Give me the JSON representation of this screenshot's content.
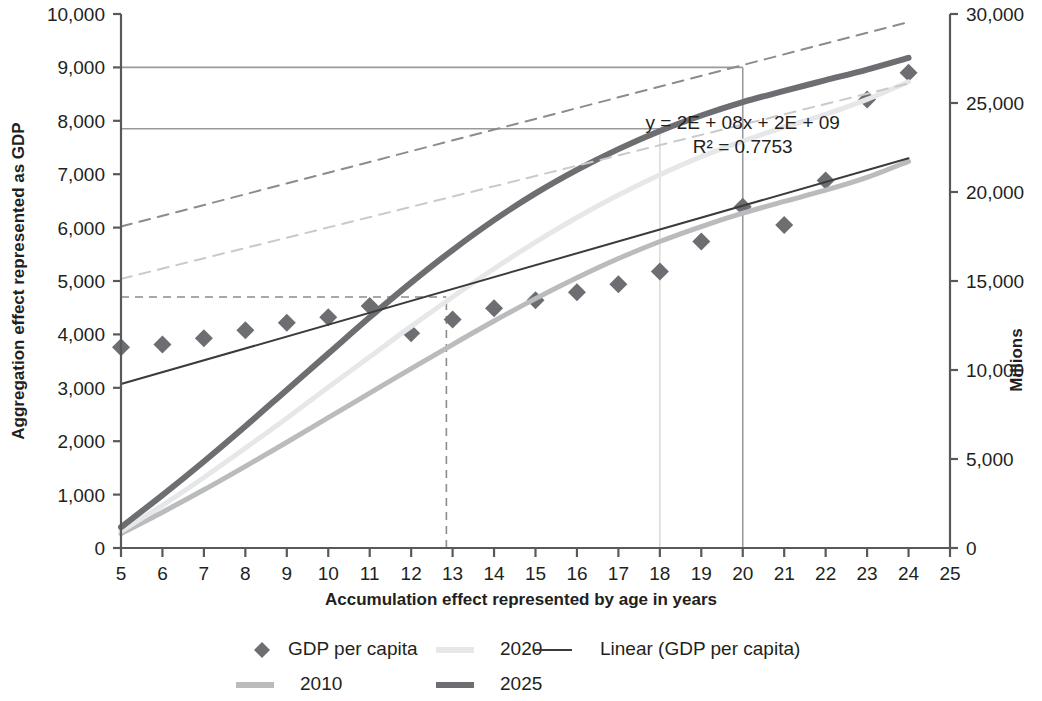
{
  "chart_data": {
    "type": "scatter",
    "title": "",
    "xlabel": "Accumulation effect represented by age in years",
    "ylabel": "Aggregation effect represented as GDP",
    "y2label": "Millions",
    "xlim": [
      5,
      25
    ],
    "ylim": [
      0,
      10000
    ],
    "y2lim": [
      0,
      30000
    ],
    "grid": false,
    "legend_position": "bottom",
    "x_ticks": [
      "5",
      "6",
      "7",
      "8",
      "9",
      "10",
      "11",
      "12",
      "13",
      "14",
      "15",
      "16",
      "17",
      "18",
      "19",
      "20",
      "21",
      "22",
      "23",
      "24",
      "25"
    ],
    "y_ticks": [
      "0",
      "1,000",
      "2,000",
      "3,000",
      "4,000",
      "5,000",
      "6,000",
      "7,000",
      "8,000",
      "9,000",
      "10,000"
    ],
    "y2_ticks": [
      "0",
      "5,000",
      "10,000",
      "15,000",
      "20,000",
      "25,000",
      "30,000"
    ],
    "annotations": [
      {
        "name": "trendline-equation",
        "text": "y = 2E + 08x + 2E + 09",
        "x": 20.0,
        "y": 7850
      },
      {
        "name": "r-squared",
        "text": "R² = 0.7753",
        "x": 20.0,
        "y": 7400
      }
    ],
    "series": [
      {
        "name": "GDP per capita",
        "type": "scatter",
        "marker": "diamond",
        "color": "#6d6e71",
        "x": [
          5,
          6,
          7,
          8,
          9,
          10,
          11,
          12,
          13,
          14,
          15,
          16,
          17,
          18,
          19,
          20,
          21,
          22,
          23,
          24
        ],
        "values": [
          3760,
          3810,
          3930,
          4080,
          4220,
          4320,
          4530,
          4020,
          4280,
          4490,
          4640,
          4790,
          4940,
          5180,
          5740,
          6390,
          6050,
          6880,
          8400,
          8900
        ]
      },
      {
        "name": "2010",
        "type": "line",
        "color": "#b9bbbd",
        "width": 5,
        "x": [
          5,
          6,
          7,
          8,
          9,
          10,
          11,
          12,
          13,
          14,
          15,
          16,
          17,
          18,
          19,
          20,
          21,
          22,
          23,
          24
        ],
        "values": [
          270,
          670,
          1090,
          1530,
          1980,
          2440,
          2900,
          3360,
          3810,
          4250,
          4670,
          5060,
          5420,
          5740,
          6020,
          6270,
          6490,
          6700,
          6940,
          7240
        ]
      },
      {
        "name": "2020",
        "type": "line",
        "color": "#e6e7e8",
        "width": 5,
        "x": [
          5,
          6,
          7,
          8,
          9,
          10,
          11,
          12,
          13,
          14,
          15,
          16,
          17,
          18,
          19,
          20,
          21,
          22,
          23,
          24
        ],
        "values": [
          310,
          800,
          1320,
          1870,
          2430,
          3010,
          3580,
          4150,
          4700,
          5230,
          5730,
          6190,
          6610,
          6990,
          7330,
          7620,
          7880,
          8120,
          8400,
          8730
        ]
      },
      {
        "name": "2025",
        "type": "line",
        "color": "#6d6e71",
        "width": 6,
        "x": [
          5,
          6,
          7,
          8,
          9,
          10,
          11,
          12,
          13,
          14,
          15,
          16,
          17,
          18,
          19,
          20,
          21,
          22,
          23,
          24
        ],
        "values": [
          390,
          990,
          1620,
          2280,
          2960,
          3640,
          4320,
          4970,
          5580,
          6140,
          6640,
          7080,
          7470,
          7810,
          8100,
          8350,
          8560,
          8760,
          8960,
          9180
        ]
      },
      {
        "name": "Linear (GDP per capita)",
        "type": "line",
        "style": "solid",
        "color": "#3b3b3b",
        "width": 2,
        "x": [
          5,
          24
        ],
        "values": [
          3070,
          7300
        ]
      },
      {
        "name": "trend-dashed-upper",
        "type": "line",
        "style": "dashed",
        "color": "#8a8c8e",
        "width": 2,
        "x": [
          5,
          24
        ],
        "values": [
          6020,
          9850
        ]
      },
      {
        "name": "trend-dashed-lower",
        "type": "line",
        "style": "dashed",
        "color": "#c8cacb",
        "width": 2,
        "x": [
          5,
          24
        ],
        "values": [
          5040,
          8700
        ]
      }
    ],
    "reference_lines": [
      {
        "name": "ref-h-9000",
        "orientation": "horizontal",
        "value": 9000,
        "from_x": 5,
        "to_x": 20,
        "style": "solid",
        "color": "#9a9a9a"
      },
      {
        "name": "ref-v-20",
        "orientation": "vertical",
        "value": 20,
        "from_y": 0,
        "to_y": 9000,
        "style": "solid",
        "color": "#9a9a9a"
      },
      {
        "name": "ref-h-7850",
        "orientation": "horizontal",
        "value": 7850,
        "from_x": 5,
        "to_x": 18,
        "style": "solid",
        "color": "#9a9a9a"
      },
      {
        "name": "ref-v-18",
        "orientation": "vertical",
        "value": 18,
        "from_y": 0,
        "to_y": 7850,
        "style": "solid",
        "color": "#dcdcdc"
      },
      {
        "name": "ref-h-4700",
        "orientation": "horizontal",
        "value": 4700,
        "from_x": 5,
        "to_x": 12.85,
        "style": "dashed",
        "color": "#8a8c8e"
      },
      {
        "name": "ref-v-1285",
        "orientation": "vertical",
        "value": 12.85,
        "from_y": 0,
        "to_y": 4700,
        "style": "dashed",
        "color": "#8a8c8e"
      }
    ],
    "legend": [
      {
        "label": "GDP per capita",
        "marker": "diamond",
        "color": "#6d6e71"
      },
      {
        "label": "2020",
        "marker": "line",
        "color": "#e6e7e8"
      },
      {
        "label": "Linear (GDP per capita)",
        "marker": "thin-line",
        "color": "#3b3b3b"
      },
      {
        "label": "2010",
        "marker": "line",
        "color": "#b9bbbd"
      },
      {
        "label": "2025",
        "marker": "line",
        "color": "#6d6e71"
      }
    ]
  }
}
